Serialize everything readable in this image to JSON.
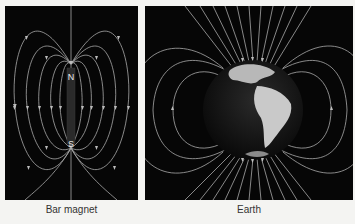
{
  "figure": {
    "panels": [
      {
        "id": "bar-magnet",
        "caption": "Bar magnet",
        "labels": {
          "north": "N",
          "south": "S"
        }
      },
      {
        "id": "earth",
        "caption": "Earth"
      }
    ]
  },
  "colors": {
    "background": "#060606",
    "field_lines": "#bdbdbd",
    "page": "#f4f4f2"
  }
}
